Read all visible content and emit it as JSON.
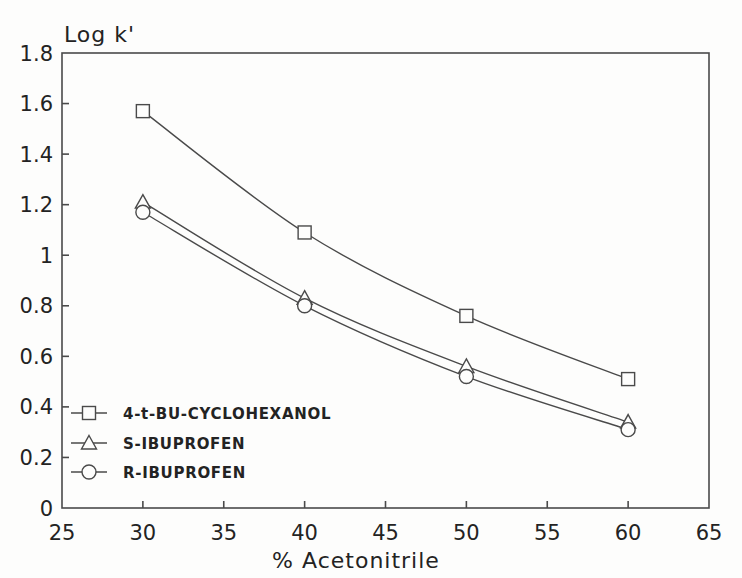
{
  "figure": {
    "background": "#fdfdfc",
    "ink_color": "#4a4a4a",
    "text_color": "#232323",
    "marker_fill": "#fdfdfc"
  },
  "chart_data": {
    "type": "line",
    "title": "",
    "ylabel": "Log k'",
    "xlabel": "% Acetonitrile",
    "xlim": [
      25,
      65
    ],
    "ylim": [
      0,
      1.8
    ],
    "xticks": [
      25,
      30,
      35,
      40,
      45,
      50,
      55,
      60,
      65
    ],
    "xtick_labels": [
      "25",
      "30",
      "35",
      "40",
      "45",
      "50",
      "55",
      "60",
      "65"
    ],
    "yticks": [
      0,
      0.2,
      0.4,
      0.6,
      0.8,
      1,
      1.2,
      1.4,
      1.6,
      1.8
    ],
    "ytick_labels": [
      "0",
      "0.2",
      "0.4",
      "0.6",
      "0.8",
      "1",
      "1.2",
      "1.4",
      "1.6",
      "1.8"
    ],
    "grid": false,
    "legend_position": "inside-lower-left",
    "x": [
      30,
      40,
      50,
      60
    ],
    "series": [
      {
        "name": "4-t-BU-CYCLOHEXANOL",
        "marker": "square",
        "values": [
          1.57,
          1.09,
          0.76,
          0.51
        ]
      },
      {
        "name": "S-IBUPROFEN",
        "marker": "triangle",
        "values": [
          1.21,
          0.83,
          0.56,
          0.34
        ]
      },
      {
        "name": "R-IBUPROFEN",
        "marker": "circle",
        "values": [
          1.17,
          0.8,
          0.52,
          0.31
        ]
      }
    ]
  }
}
